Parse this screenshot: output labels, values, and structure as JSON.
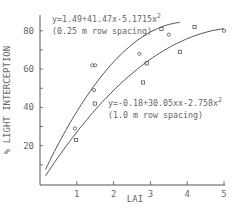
{
  "chart_data": {
    "type": "scatter",
    "title": "",
    "xlabel": "LAI",
    "ylabel": "% LIGHT INTERCEPTION",
    "xlim": [
      0,
      5
    ],
    "ylim": [
      0,
      88
    ],
    "xticks": [
      1,
      2,
      3,
      4,
      5
    ],
    "xtick_labels": [
      "1",
      "2",
      "3",
      "4",
      "5"
    ],
    "yticks": [
      10,
      20,
      30,
      40,
      50,
      60,
      70,
      80
    ],
    "ytick_labels": [
      "20",
      "40",
      "60",
      "80"
    ],
    "grid": false,
    "legend": "none",
    "series": [
      {
        "name": "0.25 m row spacing",
        "marker": "circle",
        "equation": "y=1.49+41.47x-5.1715x²",
        "fit": {
          "a": 1.49,
          "b": 41.47,
          "c": -5.1715,
          "x_range": [
            0.15,
            3.8
          ]
        },
        "points": [
          [
            0.95,
            29
          ],
          [
            1.42,
            62
          ],
          [
            1.5,
            62
          ],
          [
            1.47,
            49
          ],
          [
            2.7,
            68
          ],
          [
            3.5,
            78
          ],
          [
            5.0,
            80
          ]
        ]
      },
      {
        "name": "1.0 m row spacing",
        "marker": "square",
        "equation": "y=-0.18+30.05xx-2.758x²",
        "fit": {
          "a": -0.18,
          "b": 30.05,
          "c": -2.758,
          "x_range": [
            0.15,
            5.0
          ]
        },
        "points": [
          [
            0.98,
            23
          ],
          [
            1.49,
            42
          ],
          [
            2.8,
            53
          ],
          [
            2.9,
            63
          ],
          [
            3.3,
            81
          ],
          [
            3.8,
            69
          ],
          [
            4.2,
            82
          ]
        ]
      }
    ],
    "annotations": [
      {
        "line1": "y=1.49+41.47x-5.1715x",
        "sup": "2",
        "line2": "(0.25 m row spacing)"
      },
      {
        "line1": "y=-0.18+30.05xx-2.758x",
        "sup": "2",
        "line2": "(1.0 m row spacing)"
      }
    ]
  },
  "colors": {
    "ink": "#555555",
    "background": "#ffffff"
  }
}
